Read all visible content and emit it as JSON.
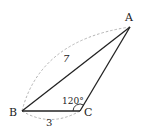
{
  "diagram": {
    "type": "triangle",
    "vertices": {
      "A": {
        "label": "A",
        "x": 130,
        "y": 27
      },
      "B": {
        "label": "B",
        "x": 22,
        "y": 111
      },
      "C": {
        "label": "C",
        "x": 80,
        "y": 111
      }
    },
    "edges": [
      {
        "from": "A",
        "to": "B",
        "style": "solid"
      },
      {
        "from": "B",
        "to": "C",
        "style": "solid"
      },
      {
        "from": "C",
        "to": "A",
        "style": "solid"
      }
    ],
    "measurements": {
      "AB": {
        "label": "7",
        "style": "dashed-arc"
      },
      "BC": {
        "label": "3",
        "style": "dashed-arc"
      }
    },
    "angle": {
      "vertex": "C",
      "label": "120°"
    },
    "colors": {
      "line": "#222222",
      "dashed": "#aaaaaa"
    }
  }
}
